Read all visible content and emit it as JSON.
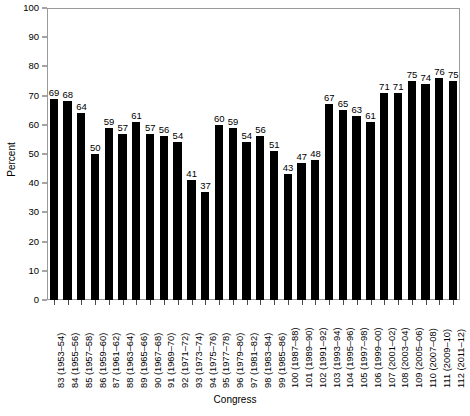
{
  "chart_data": {
    "type": "bar",
    "title": "",
    "subtitle": "",
    "xlabel": "Congress",
    "ylabel": "Percent",
    "ylim": [
      0,
      100
    ],
    "ytick_values": [
      0,
      10,
      20,
      30,
      40,
      50,
      60,
      70,
      80,
      90,
      100
    ],
    "ytick_labels": [
      "0",
      "10",
      "20",
      "30",
      "40",
      "50",
      "60",
      "70",
      "80",
      "90",
      "100"
    ],
    "grid": false,
    "legend": null,
    "legend_position": "none",
    "bar_color": "#000000",
    "frame_color": "#9a9a9a",
    "categories": [
      "83 (1953–54)",
      "84 (1955–56)",
      "85 (1957–58)",
      "86 (1959–60)",
      "87 (1961–62)",
      "88 (1963–64)",
      "89 (1965–66)",
      "90 (1967–68)",
      "91 (1969–70)",
      "92 (1971–72)",
      "93 (1973–74)",
      "94 (1975–76)",
      "95 (1977–78)",
      "96 (1979–80)",
      "97 (1981–82)",
      "98 (1983–84)",
      "99 (1985–86)",
      "100 (1987–88)",
      "101 (1989–90)",
      "102 (1991–92)",
      "103 (1993–94)",
      "104 (1995–96)",
      "105 (1997–98)",
      "106 (1999–00)",
      "107 (2001–02)",
      "108 (2003–04)",
      "109 (2005–06)",
      "110 (2007–08)",
      "111 (2009–10)",
      "112 (2011–12)"
    ],
    "values": [
      69,
      68,
      64,
      50,
      59,
      57,
      61,
      57,
      56,
      54,
      41,
      37,
      60,
      59,
      54,
      56,
      51,
      43,
      47,
      48,
      67,
      65,
      63,
      61,
      71,
      71,
      75,
      74,
      76,
      75
    ],
    "data_labels": [
      "69",
      "68",
      "64",
      "50",
      "59",
      "57",
      "61",
      "57",
      "56",
      "54",
      "41",
      "37",
      "60",
      "59",
      "54",
      "56",
      "51",
      "43",
      "47",
      "48",
      "67",
      "65",
      "63",
      "61",
      "71",
      "71",
      "75",
      "74",
      "76",
      "75"
    ]
  }
}
